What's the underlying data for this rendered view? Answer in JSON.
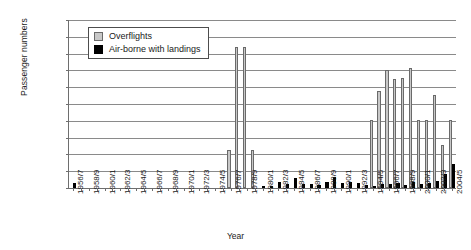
{
  "chart_data": {
    "type": "bar",
    "title": "",
    "xlabel": "Year",
    "ylabel": "Passenger numbers",
    "ylim": [
      0,
      5000
    ],
    "ytick_step": 500,
    "yticks": [
      0,
      500,
      1000,
      1500,
      2000,
      2500,
      3000,
      3500,
      4000,
      4500,
      5000
    ],
    "grid": true,
    "legend_position": "top-left-inside",
    "tick_label_every": 2,
    "categories": [
      "1956/7",
      "1957/8",
      "1958/9",
      "1959/0",
      "1960/1",
      "1961/2",
      "1962/3",
      "1963/4",
      "1964/5",
      "1965/6",
      "1966/7",
      "1967/8",
      "1968/9",
      "1969/0",
      "1970/1",
      "1971/2",
      "1972/3",
      "1973/4",
      "1974/5",
      "1975/6",
      "1976/7",
      "1977/8",
      "1978/9",
      "1979/0",
      "1980/1",
      "1981/2",
      "1982/3",
      "1983/4",
      "1984/5",
      "1985/6",
      "1986/7",
      "1987/8",
      "1988/9",
      "1989/0",
      "1990/1",
      "1991/2",
      "1992/3",
      "1993/4",
      "1994/5",
      "1995/6",
      "1996/7",
      "1997/8",
      "1998/9",
      "1999/0",
      "2000/1",
      "2001/2",
      "2002/3",
      "2003/4",
      "2004/5"
    ],
    "tick_labels": [
      "1956/7",
      "1958/9",
      "1960/1",
      "1962/3",
      "1964/5",
      "1966/7",
      "1968/9",
      "1970/1",
      "1972/3",
      "1974/5",
      "1976/7",
      "1978/9",
      "1980/1",
      "1982/3",
      "1984/5",
      "1986/7",
      "1988/9",
      "1990/1",
      "1992/3",
      "1994/5",
      "1996/7",
      "1998/9",
      "2000/1",
      "2002/3",
      "2004/5"
    ],
    "series": [
      {
        "name": "Overflights",
        "color": "#c8c8c8",
        "values": [
          0,
          0,
          0,
          0,
          0,
          0,
          0,
          0,
          0,
          0,
          0,
          0,
          0,
          0,
          0,
          0,
          0,
          0,
          0,
          0,
          1120,
          4210,
          4200,
          1120,
          0,
          0,
          0,
          0,
          0,
          0,
          0,
          0,
          0,
          0,
          0,
          0,
          0,
          0,
          2030,
          2900,
          3500,
          3250,
          3280,
          3580,
          2020,
          2010,
          2780,
          1280,
          2010
        ]
      },
      {
        "name": "Air-borne with landings",
        "color": "#000000",
        "values": [
          160,
          0,
          0,
          0,
          0,
          0,
          0,
          0,
          0,
          0,
          0,
          0,
          0,
          0,
          0,
          0,
          0,
          0,
          0,
          0,
          0,
          0,
          0,
          0,
          30,
          40,
          180,
          120,
          290,
          130,
          110,
          80,
          170,
          330,
          160,
          180,
          150,
          100,
          70,
          110,
          130,
          150,
          80,
          170,
          120,
          140,
          200,
          410,
          700
        ]
      }
    ]
  },
  "legend": {
    "items": [
      {
        "label": "Overflights"
      },
      {
        "label": "Air-borne with landings"
      }
    ]
  }
}
